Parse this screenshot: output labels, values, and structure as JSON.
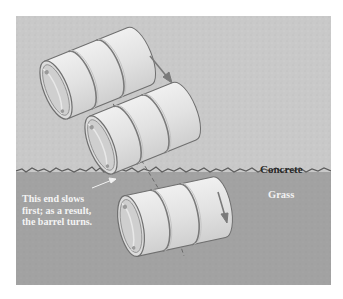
{
  "figure": {
    "labels": {
      "upper_medium": "Concrete",
      "lower_medium": "Grass",
      "annotation_lines": [
        "This end slows",
        "first; as a result,",
        "the barrel turns."
      ]
    },
    "colors": {
      "concrete": "#c9c9c9",
      "grass": "#a2a2a2",
      "barrel_body": "#e4e4e4",
      "barrel_outline": "#6f6f6f",
      "arrow": "#7a7a7a",
      "background": "#ffffff"
    },
    "barrels": [
      {
        "position": "top",
        "medium": "concrete",
        "motion_arrow": "down-right"
      },
      {
        "position": "middle",
        "medium": "crossing boundary",
        "motion_arrow": "none"
      },
      {
        "position": "bottom",
        "medium": "grass",
        "motion_arrow": "down"
      }
    ]
  }
}
